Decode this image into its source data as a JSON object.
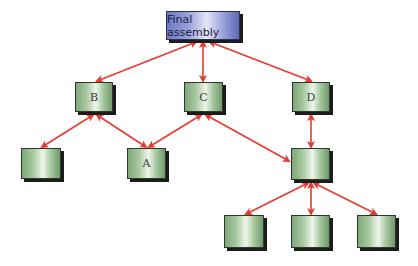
{
  "diagram": {
    "type": "tree",
    "title": "",
    "colors": {
      "arrow": "#e8392f",
      "root_fill": "#8e96d6",
      "node_fill": "#a9c9a2",
      "shadow": "#1c1c1c"
    },
    "nodes": [
      {
        "id": "root",
        "label": "Final assembly",
        "x": 166,
        "y": 11,
        "w": 74,
        "h": 29,
        "style": "blue"
      },
      {
        "id": "B",
        "label": "B",
        "x": 75,
        "y": 82,
        "w": 38,
        "h": 30,
        "style": "green"
      },
      {
        "id": "C",
        "label": "C",
        "x": 184,
        "y": 82,
        "w": 39,
        "h": 30,
        "style": "green"
      },
      {
        "id": "D",
        "label": "D",
        "x": 292,
        "y": 82,
        "w": 38,
        "h": 30,
        "style": "green"
      },
      {
        "id": "B1",
        "label": "",
        "x": 21,
        "y": 148,
        "w": 40,
        "h": 31,
        "style": "green"
      },
      {
        "id": "A",
        "label": "A",
        "x": 127,
        "y": 148,
        "w": 39,
        "h": 31,
        "style": "green"
      },
      {
        "id": "E",
        "label": "",
        "x": 291,
        "y": 148,
        "w": 39,
        "h": 32,
        "style": "green"
      },
      {
        "id": "E1",
        "label": "",
        "x": 224,
        "y": 215,
        "w": 40,
        "h": 33,
        "style": "green"
      },
      {
        "id": "E2",
        "label": "",
        "x": 291,
        "y": 215,
        "w": 39,
        "h": 33,
        "style": "green"
      },
      {
        "id": "E3",
        "label": "",
        "x": 357,
        "y": 215,
        "w": 39,
        "h": 33,
        "style": "green"
      }
    ],
    "edges": [
      {
        "from": "root",
        "to": "B",
        "x1": 196,
        "y1": 42,
        "x2": 97,
        "y2": 81
      },
      {
        "from": "root",
        "to": "C",
        "x1": 203,
        "y1": 42,
        "x2": 203,
        "y2": 81
      },
      {
        "from": "root",
        "to": "D",
        "x1": 210,
        "y1": 42,
        "x2": 311,
        "y2": 81
      },
      {
        "from": "B",
        "to": "B1",
        "x1": 93,
        "y1": 115,
        "x2": 42,
        "y2": 147
      },
      {
        "from": "B",
        "to": "A",
        "x1": 97,
        "y1": 115,
        "x2": 146,
        "y2": 147
      },
      {
        "from": "C",
        "to": "A",
        "x1": 201,
        "y1": 115,
        "x2": 149,
        "y2": 147
      },
      {
        "from": "C",
        "to": "E",
        "x1": 206,
        "y1": 115,
        "x2": 289,
        "y2": 161
      },
      {
        "from": "D",
        "to": "E",
        "x1": 311,
        "y1": 115,
        "x2": 311,
        "y2": 147
      },
      {
        "from": "E",
        "to": "E1",
        "x1": 308,
        "y1": 183,
        "x2": 246,
        "y2": 214
      },
      {
        "from": "E",
        "to": "E2",
        "x1": 311,
        "y1": 183,
        "x2": 311,
        "y2": 214
      },
      {
        "from": "E",
        "to": "E3",
        "x1": 314,
        "y1": 183,
        "x2": 376,
        "y2": 214
      }
    ]
  }
}
